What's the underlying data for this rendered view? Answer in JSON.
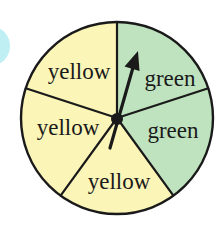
{
  "spinner": {
    "sectors": [
      {
        "label": "green",
        "color": "#bfe3bf"
      },
      {
        "label": "green",
        "color": "#bfe3bf"
      },
      {
        "label": "yellow",
        "color": "#fbf5b8"
      },
      {
        "label": "yellow",
        "color": "#fbf5b8"
      },
      {
        "label": "yellow",
        "color": "#fbf5b8"
      }
    ],
    "outline_color": "#1a1a1a",
    "arrow_color": "#1a1a1a"
  },
  "decoration": {
    "edge_circle_color": "#bfeef3"
  }
}
